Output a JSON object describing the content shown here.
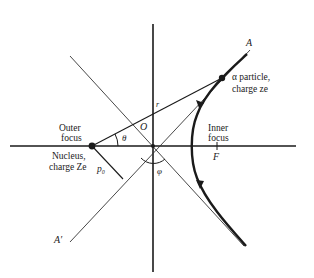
{
  "diagram": {
    "axes": {
      "x_label": "x",
      "y_label": "y"
    },
    "labels": {
      "outer_focus_line1": "Outer",
      "outer_focus_line2": "focus",
      "nucleus_line1": "Nucleus,",
      "nucleus_line2": "charge Ze",
      "inner_focus_line1": "Inner",
      "inner_focus_line2": "focus",
      "particle_line1": "α particle,",
      "particle_line2": "charge ze",
      "asymptote_A": "A",
      "asymptote_A_prime": "A′",
      "origin": "O",
      "radius": "r",
      "theta": "θ",
      "phi": "φ",
      "impact_parameter": "p₀",
      "focus_F": "F"
    },
    "colors": {
      "ink": "#1a1a1a",
      "thin": "#444444",
      "background": "#ffffff"
    }
  }
}
